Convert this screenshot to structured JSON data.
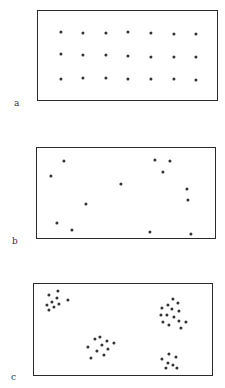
{
  "figure": {
    "panels": [
      {
        "id": "a",
        "label": "a",
        "pattern": "uniform",
        "frame": {
          "x": 37,
          "y": 10,
          "w": 181,
          "h": 91
        },
        "label_pos": {
          "x": 14,
          "y": 99
        },
        "dots": [
          [
            61,
            32
          ],
          [
            83,
            33
          ],
          [
            106,
            33
          ],
          [
            128,
            32
          ],
          [
            151,
            33
          ],
          [
            174,
            34
          ],
          [
            196,
            34
          ],
          [
            61,
            54
          ],
          [
            83,
            55
          ],
          [
            106,
            55
          ],
          [
            128,
            56
          ],
          [
            151,
            57
          ],
          [
            174,
            57
          ],
          [
            196,
            57
          ],
          [
            61,
            79
          ],
          [
            83,
            78
          ],
          [
            106,
            78
          ],
          [
            128,
            79
          ],
          [
            151,
            79
          ],
          [
            174,
            79
          ],
          [
            196,
            80
          ]
        ]
      },
      {
        "id": "b",
        "label": "b",
        "pattern": "random",
        "frame": {
          "x": 36,
          "y": 147,
          "w": 180,
          "h": 92
        },
        "label_pos": {
          "x": 12,
          "y": 237
        },
        "dots": [
          [
            64,
            161
          ],
          [
            51,
            176
          ],
          [
            155,
            160
          ],
          [
            170,
            161
          ],
          [
            163,
            172
          ],
          [
            121,
            184
          ],
          [
            187,
            189
          ],
          [
            188,
            200
          ],
          [
            86,
            204
          ],
          [
            57,
            223
          ],
          [
            72,
            230
          ],
          [
            150,
            232
          ],
          [
            191,
            234
          ]
        ]
      },
      {
        "id": "c",
        "label": "c",
        "pattern": "clumped",
        "frame": {
          "x": 33,
          "y": 283,
          "w": 180,
          "h": 93
        },
        "label_pos": {
          "x": 11,
          "y": 373
        },
        "dots": [
          [
            49,
            295
          ],
          [
            58,
            291
          ],
          [
            52,
            302
          ],
          [
            57,
            298
          ],
          [
            47,
            305
          ],
          [
            54,
            307
          ],
          [
            59,
            304
          ],
          [
            68,
            300
          ],
          [
            49,
            310
          ],
          [
            173,
            299
          ],
          [
            168,
            305
          ],
          [
            178,
            303
          ],
          [
            162,
            308
          ],
          [
            172,
            309
          ],
          [
            179,
            311
          ],
          [
            161,
            315
          ],
          [
            167,
            315
          ],
          [
            174,
            317
          ],
          [
            163,
            322
          ],
          [
            169,
            325
          ],
          [
            179,
            321
          ],
          [
            186,
            322
          ],
          [
            181,
            328
          ],
          [
            95,
            339
          ],
          [
            100,
            337
          ],
          [
            107,
            341
          ],
          [
            114,
            343
          ],
          [
            88,
            347
          ],
          [
            102,
            345
          ],
          [
            97,
            351
          ],
          [
            108,
            349
          ],
          [
            91,
            358
          ],
          [
            104,
            355
          ],
          [
            169,
            354
          ],
          [
            162,
            359
          ],
          [
            176,
            357
          ],
          [
            168,
            363
          ],
          [
            173,
            365
          ],
          [
            166,
            368
          ],
          [
            177,
            368
          ]
        ]
      }
    ],
    "colors": {
      "dot": "#333333",
      "frame": "#2a2a2a",
      "label": "#333333",
      "background": "#ffffff"
    }
  }
}
